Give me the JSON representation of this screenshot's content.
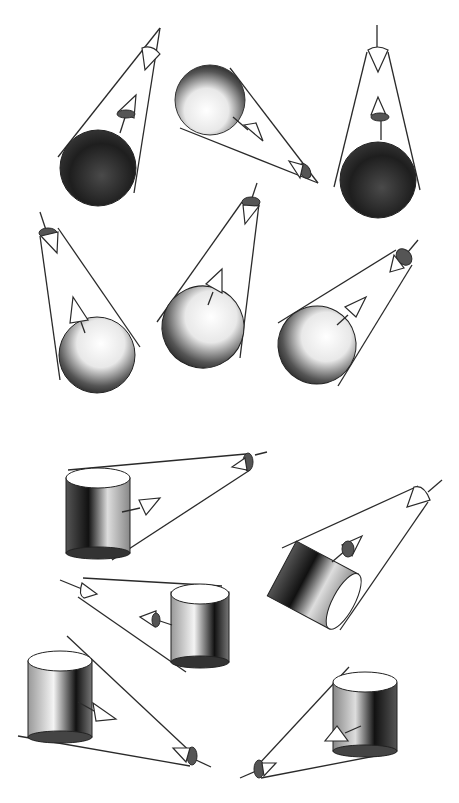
{
  "illustration": {
    "title": "",
    "background": "#ffffff",
    "ink": "#2a2a2a",
    "spheres": [
      {
        "id": "s1",
        "cx": 98,
        "cy": 168,
        "r": 38,
        "eye": [
          152,
          42
        ],
        "dark": 0.85
      },
      {
        "id": "s2",
        "cx": 210,
        "cy": 100,
        "r": 35,
        "eye": [
          305,
          172
        ],
        "dark": 0.55
      },
      {
        "id": "s3",
        "cx": 378,
        "cy": 180,
        "r": 38,
        "eye": [
          377,
          50
        ],
        "dark": 0.85
      },
      {
        "id": "s4",
        "cx": 97,
        "cy": 355,
        "r": 38,
        "eye": [
          47,
          232
        ],
        "dark": 0.45
      },
      {
        "id": "s5",
        "cx": 203,
        "cy": 327,
        "r": 41,
        "eye": [
          251,
          202
        ],
        "dark": 0.45
      },
      {
        "id": "s6",
        "cx": 317,
        "cy": 345,
        "r": 39,
        "eye": [
          402,
          257
        ],
        "dark": 0.5
      }
    ],
    "cylinders": [
      {
        "id": "c1",
        "x": 66,
        "y": 470,
        "w": 64,
        "h": 85,
        "eye": [
          243,
          462
        ]
      },
      {
        "id": "c2",
        "x": 171,
        "y": 587,
        "w": 58,
        "h": 80,
        "eye": [
          84,
          587
        ]
      },
      {
        "id": "c3",
        "x": 28,
        "y": 652,
        "w": 64,
        "h": 90,
        "eye": [
          190,
          758
        ]
      },
      {
        "id": "c4",
        "x": 333,
        "y": 673,
        "w": 64,
        "h": 82,
        "eye": [
          260,
          768
        ]
      }
    ]
  }
}
